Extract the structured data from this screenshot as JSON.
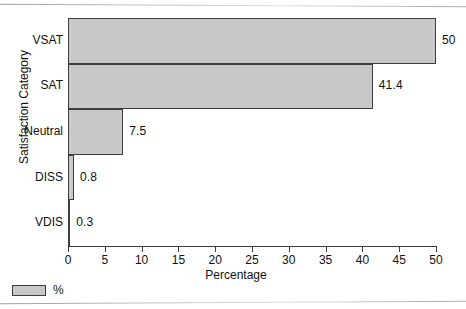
{
  "chart_data": {
    "type": "bar",
    "orientation": "horizontal",
    "title": "",
    "xlabel": "Percentage",
    "ylabel": "Satisfaction Category",
    "categories": [
      "VSAT",
      "SAT",
      "Neutral",
      "DISS",
      "VDIS"
    ],
    "values": [
      50,
      41.4,
      7.5,
      0.8,
      0.3
    ],
    "value_labels": [
      "50",
      "41.4",
      "7.5",
      "0.8",
      "0.3"
    ],
    "xlim": [
      0,
      50
    ],
    "xticks": [
      0,
      5,
      10,
      15,
      20,
      25,
      30,
      35,
      40,
      45,
      50
    ],
    "xtick_labels": [
      "0",
      "5",
      "10",
      "15",
      "20",
      "25",
      "30",
      "35",
      "40",
      "45",
      "50"
    ],
    "grid": false,
    "legend": {
      "position": "bottom-left",
      "entries": [
        {
          "label": "%",
          "color": "#c8c8c8"
        }
      ]
    },
    "series": [
      {
        "name": "%",
        "values": [
          50,
          41.4,
          7.5,
          0.8,
          0.3
        ],
        "color": "#c8c8c8",
        "edge_color": "#3d3d3d"
      }
    ]
  },
  "axes": {
    "x_title": "Percentage",
    "y_title": "Satisfaction Category"
  },
  "legend": {
    "label": "%"
  },
  "colors": {
    "bar_fill": "#c8c8c8",
    "bar_edge": "#3d3d3d",
    "axis": "#3d3d3d",
    "text": "#111111",
    "background": "#ffffff"
  }
}
